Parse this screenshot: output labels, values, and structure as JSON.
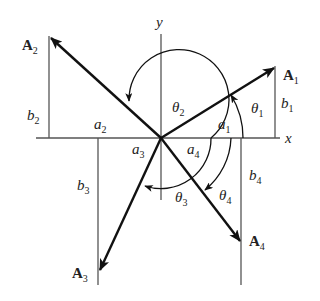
{
  "diagram": {
    "axes": {
      "x_label": "x",
      "y_label": "y"
    },
    "vectors": [
      {
        "name": "A",
        "sub": "1",
        "quadrant": 1,
        "a_label": "a",
        "a_sub": "1",
        "b_label": "b",
        "b_sub": "1",
        "angle_label": "θ",
        "angle_sub": "1"
      },
      {
        "name": "A",
        "sub": "2",
        "quadrant": 2,
        "a_label": "a",
        "a_sub": "2",
        "b_label": "b",
        "b_sub": "2",
        "angle_label": "θ",
        "angle_sub": "2"
      },
      {
        "name": "A",
        "sub": "3",
        "quadrant": 3,
        "a_label": "a",
        "a_sub": "3",
        "b_label": "b",
        "b_sub": "3",
        "angle_label": "θ",
        "angle_sub": "3"
      },
      {
        "name": "A",
        "sub": "4",
        "quadrant": 4,
        "a_label": "a",
        "a_sub": "4",
        "b_label": "b",
        "b_sub": "4",
        "angle_label": "θ",
        "angle_sub": "4"
      }
    ],
    "colors": {
      "line": "#111111",
      "axis": "#555555",
      "text": "#222222"
    }
  }
}
